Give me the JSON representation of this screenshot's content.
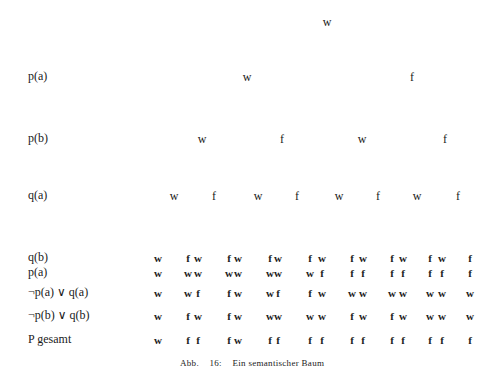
{
  "tree": {
    "levels": [
      {
        "label": "",
        "y": 22,
        "nodes": [
          {
            "v": "w",
            "x": 327
          }
        ]
      },
      {
        "label": "p(a)",
        "y": 77,
        "nodes": [
          {
            "v": "w",
            "x": 247
          },
          {
            "v": "f",
            "x": 412
          }
        ]
      },
      {
        "label": "p(b)",
        "y": 139,
        "nodes": [
          {
            "v": "w",
            "x": 202
          },
          {
            "v": "f",
            "x": 282
          },
          {
            "v": "w",
            "x": 362
          },
          {
            "v": "f",
            "x": 445
          }
        ]
      },
      {
        "label": "q(a)",
        "y": 196,
        "nodes": [
          {
            "v": "w",
            "x": 174
          },
          {
            "v": "f",
            "x": 214
          },
          {
            "v": "w",
            "x": 258
          },
          {
            "v": "f",
            "x": 297
          },
          {
            "v": "w",
            "x": 339
          },
          {
            "v": "f",
            "x": 378
          },
          {
            "v": "w",
            "x": 417
          },
          {
            "v": "f",
            "x": 458
          }
        ]
      }
    ],
    "leaf_x": [
      158,
      188,
      198,
      229,
      238,
      270,
      278,
      310,
      322,
      352,
      363,
      392,
      403,
      430,
      442,
      470
    ]
  },
  "table": {
    "rows": [
      {
        "label": "q(b)",
        "y": 258,
        "values": [
          "w",
          "f",
          "w",
          "f",
          "w",
          "f",
          "w",
          "f",
          "w",
          "f",
          "w",
          "f",
          "w",
          "f",
          "w",
          "f"
        ]
      },
      {
        "label": "p(a)",
        "y": 273,
        "values": [
          "w",
          "w",
          "w",
          "w",
          "w",
          "w",
          "w",
          "w",
          "f",
          "f",
          "f",
          "f",
          "f",
          "f",
          "f",
          "f"
        ]
      },
      {
        "label": "¬p(a) ∨ q(a)",
        "y": 293,
        "values": [
          "w",
          "w",
          "f",
          "f",
          "w",
          "w",
          "f",
          "f",
          "w",
          "w",
          "w",
          "w",
          "w",
          "w",
          "w",
          "w"
        ]
      },
      {
        "label": "¬p(b) ∨ q(b)",
        "y": 316,
        "values": [
          "w",
          "f",
          "w",
          "f",
          "w",
          "w",
          "w",
          "w",
          "w",
          "f",
          "w",
          "f",
          "w",
          "w",
          "w",
          "w"
        ]
      },
      {
        "label": "P gesamt",
        "y": 340,
        "values": [
          "w",
          "f",
          "f",
          "f",
          "w",
          "f",
          "f",
          "f",
          "f",
          "f",
          "f",
          "f",
          "f",
          "f",
          "f",
          "f"
        ]
      }
    ]
  },
  "caption": {
    "abbr": "Abb.",
    "number": "16:",
    "title": "Ein semantischer Baum"
  }
}
